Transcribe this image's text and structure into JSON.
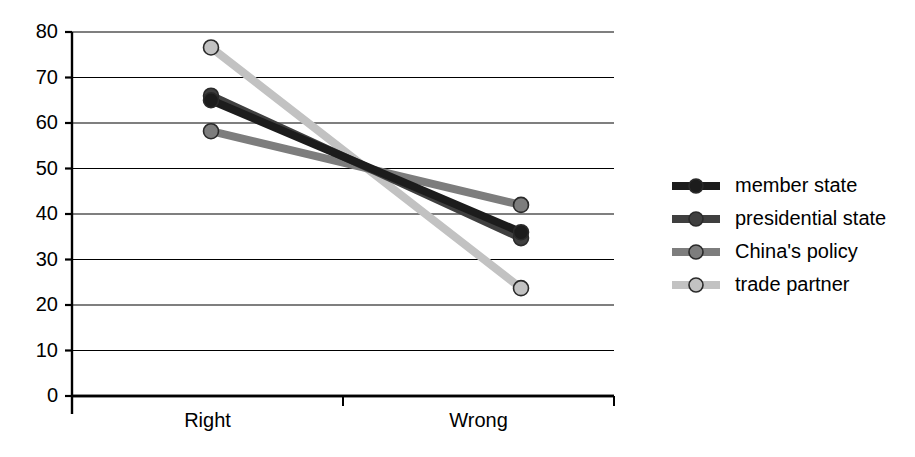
{
  "chart_data": {
    "type": "line",
    "title": "",
    "subtitle": "",
    "xlabel": "",
    "ylabel": "",
    "categories": [
      "Right",
      "Wrong"
    ],
    "xtick_labels": [
      "Right",
      "Wrong"
    ],
    "ytick_labels": [
      "0",
      "10",
      "20",
      "30",
      "40",
      "50",
      "60",
      "70",
      "80"
    ],
    "yticks": [
      0,
      10,
      20,
      30,
      40,
      50,
      60,
      70,
      80
    ],
    "ylim": [
      0,
      80
    ],
    "grid": "horizontal",
    "legend_position": "right",
    "series": [
      {
        "name": "member state",
        "values": [
          65.0,
          36.0
        ],
        "color": "#1c1c1c",
        "marker": "circle"
      },
      {
        "name": "presidential state",
        "values": [
          66.0,
          34.7
        ],
        "color": "#3f3f3f",
        "marker": "circle"
      },
      {
        "name": "China's policy",
        "values": [
          58.2,
          42.0
        ],
        "color": "#7d7d7d",
        "marker": "circle"
      },
      {
        "name": "trade partner",
        "values": [
          76.6,
          23.7
        ],
        "color": "#c2c2c2",
        "marker": "circle"
      }
    ],
    "axis_color": "#000000",
    "grid_color": "#000000",
    "background": "#ffffff"
  },
  "legend": {
    "entries": [
      {
        "label": "member state"
      },
      {
        "label": "presidential state"
      },
      {
        "label": "China's policy"
      },
      {
        "label": "trade partner"
      }
    ]
  }
}
